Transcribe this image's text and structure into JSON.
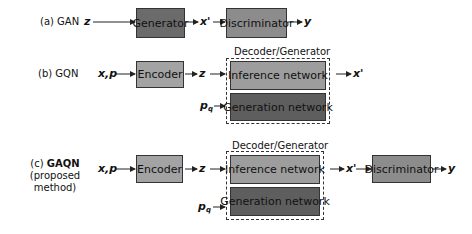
{
  "rows": [
    {
      "id": "gan",
      "label": "(a) GAN",
      "input": "z",
      "blocks": [
        "Generator",
        "Discriminator"
      ],
      "intermediate": "x'",
      "output": "y"
    },
    {
      "id": "gqn",
      "label": "(b) GQN",
      "input": "x,p",
      "encoder": "Encoder",
      "latent": "z",
      "query": "p",
      "query_sub": "q",
      "group_title": "Decoder/Generator",
      "group_blocks": [
        "Inference network",
        "Generation network"
      ],
      "output": "x'"
    },
    {
      "id": "gaqn",
      "label_prefix": "(c) ",
      "label_bold": "GAQN",
      "label_sub": "(proposed method)",
      "input": "x,p",
      "encoder": "Encoder",
      "latent": "z",
      "query": "p",
      "query_sub": "q",
      "group_title": "Decoder/Generator",
      "group_blocks": [
        "Inference network",
        "Generation network"
      ],
      "intermediate": "x'",
      "discriminator": "Discriminator",
      "output": "y"
    }
  ],
  "colors": {
    "generator": "#6b6b6b",
    "discriminator": "#8c8c8c",
    "encoder": "#a3a3a3",
    "inference": "#9d9d9d",
    "generation": "#5e5e5e"
  }
}
